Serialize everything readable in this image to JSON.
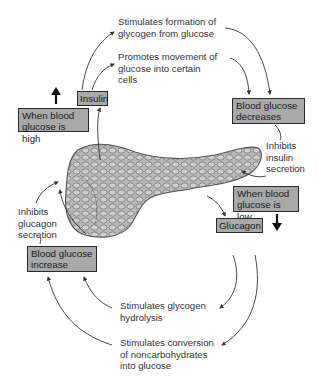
{
  "diagram": {
    "hormones": {
      "insulin": "Insulin",
      "glucagon": "Glucagon"
    },
    "conditions": {
      "high": "When blood\nglucose is high",
      "low": "When blood\nglucose is low"
    },
    "outcomes": {
      "decreases": "Blood glucose\ndecreases",
      "increase": "Blood glucose\nincrease"
    },
    "insulin_effects": [
      "Stimulates formation of\nglycogen from glucose",
      "Promotes movement of\nglucose into certain\ncells"
    ],
    "glucagon_effects": [
      "Stimulates glycogen\nhydrolysis",
      "Stimulates conversion\nof noncarbohydrates\ninto glucose"
    ],
    "feedback": {
      "inhibits_insulin": "Inhibits\ninsulin\nsecretion",
      "inhibits_glucagon": "Inhibits\nglucagon\nsecretion"
    },
    "organ": "pancreas",
    "colors": {
      "box_fill": "#a9a9a9",
      "box_border": "#2a2a2a",
      "arrow": "#333333",
      "pancreas": "#9a9a9a"
    }
  }
}
